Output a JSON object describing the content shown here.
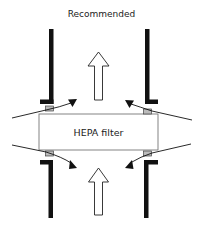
{
  "diagram": {
    "title": "Recommended",
    "filter_label": "HEPA filter",
    "colors": {
      "wall": "#111111",
      "filter_border": "#777777",
      "gasket_fill": "#bbbbbb",
      "arrow_outline": "#222222",
      "flow_line": "#111111",
      "background": "#ffffff"
    },
    "elements": [
      {
        "type": "wall",
        "position": "top-left"
      },
      {
        "type": "wall",
        "position": "top-right"
      },
      {
        "type": "wall",
        "position": "bottom-left"
      },
      {
        "type": "wall",
        "position": "bottom-right"
      },
      {
        "type": "gasket",
        "position": "top-left"
      },
      {
        "type": "gasket",
        "position": "top-right"
      },
      {
        "type": "gasket",
        "position": "bottom-left"
      },
      {
        "type": "gasket",
        "position": "bottom-right"
      },
      {
        "type": "airflow-arrow",
        "direction": "up",
        "position": "top-center"
      },
      {
        "type": "airflow-arrow",
        "direction": "up",
        "position": "bottom-center"
      },
      {
        "type": "leak-flow-line",
        "position": "top-left"
      },
      {
        "type": "leak-flow-line",
        "position": "top-right"
      },
      {
        "type": "leak-flow-line",
        "position": "bottom-left"
      },
      {
        "type": "leak-flow-line",
        "position": "bottom-right"
      }
    ]
  }
}
